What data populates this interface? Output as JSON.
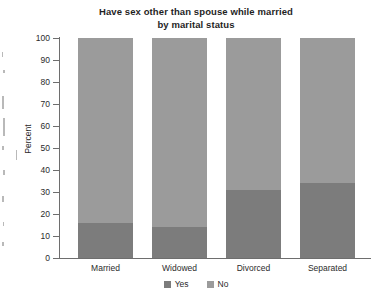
{
  "chart_data": {
    "type": "bar",
    "subtype": "stacked-100-percent",
    "title": "Have sex other than spouse while married by marital status",
    "title_lines": [
      "Have sex other than spouse while married",
      "by marital status"
    ],
    "xlabel": "",
    "ylabel": "Percent",
    "ylim": [
      0,
      100
    ],
    "yticks": [
      0,
      10,
      20,
      30,
      40,
      50,
      60,
      70,
      80,
      90,
      100
    ],
    "grid": false,
    "legend_position": "bottom",
    "categories": [
      "Married",
      "Widowed",
      "Divorced",
      "Separated"
    ],
    "series": [
      {
        "name": "Yes",
        "color": "#7c7c7c",
        "values": [
          16,
          14,
          31,
          34
        ]
      },
      {
        "name": "No",
        "color": "#9b9b9b",
        "values": [
          84,
          86,
          69,
          66
        ]
      }
    ]
  },
  "axis": {
    "y_title": "Percent",
    "y_tick_labels": [
      "100",
      "90",
      "80",
      "70",
      "60",
      "50",
      "40",
      "30",
      "20",
      "10",
      "0"
    ],
    "x_tick_labels": [
      "Married",
      "Widowed",
      "Divorced",
      "Separated"
    ]
  },
  "legend": {
    "items": [
      {
        "label": "Yes",
        "color": "#7c7c7c"
      },
      {
        "label": "No",
        "color": "#9b9b9b"
      }
    ]
  },
  "colors": {
    "yes": "#7c7c7c",
    "no": "#9b9b9b",
    "axis": "#6e6e6e",
    "text": "#2b2b2b",
    "background": "#ffffff"
  }
}
